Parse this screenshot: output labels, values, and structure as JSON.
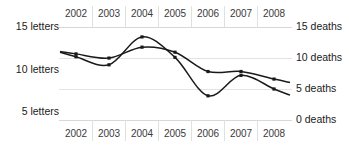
{
  "chart_data": {
    "type": "line",
    "title": "",
    "subtitle": "",
    "xlabel": "",
    "grid": true,
    "legend_position": "none",
    "x": [
      2002,
      2003,
      2004,
      2005,
      2006,
      2007,
      2008
    ],
    "categories": [
      "2002",
      "2003",
      "2004",
      "2005",
      "2006",
      "2007",
      "2008"
    ],
    "top_tick_labels": [
      "2002",
      "2003",
      "2004",
      "2005",
      "2006",
      "2007",
      "2008"
    ],
    "bottom_tick_labels": [
      "2002",
      "2003",
      "2004",
      "2005",
      "2006",
      "2007",
      "2008"
    ],
    "axes": {
      "left": {
        "label": "letters",
        "ticks": [
          15,
          10,
          5
        ],
        "tick_labels": [
          "15 letters",
          "10 letters",
          "5 letters"
        ],
        "ylim": [
          5,
          15
        ]
      },
      "right": {
        "label": "deaths",
        "ticks": [
          15,
          10,
          5,
          0
        ],
        "tick_labels": [
          "15 deaths",
          "10 deaths",
          "5 deaths",
          "0 deaths"
        ],
        "ylim": [
          0,
          15
        ]
      }
    },
    "series": [
      {
        "name": "deaths",
        "axis": "right",
        "values": [
          10.2,
          8.9,
          13.4,
          10.1,
          3.9,
          7.2,
          5.0
        ],
        "color": "#1a1a1a"
      },
      {
        "name": "letters",
        "axis": "left",
        "values": [
          11.8,
          11.3,
          12.6,
          12.0,
          9.7,
          9.7,
          8.8
        ],
        "color": "#1a1a1a"
      }
    ]
  },
  "colors": {
    "line": "#1a1a1a",
    "grid": "#e3e3e3",
    "text": "#1a1a1a",
    "year_text": "#3a3a3a",
    "background": "#ffffff"
  }
}
